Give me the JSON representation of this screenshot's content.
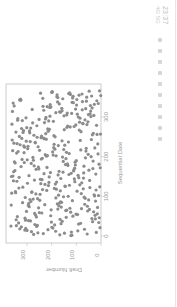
{
  "status_bar": {
    "time": "23:37",
    "info": "4G 5G",
    "icons": [
      "notification-icon",
      "app-icon",
      "app-icon",
      "app-icon",
      "app-icon",
      "app-icon",
      "app-icon",
      "app-icon",
      "app-icon",
      "app-icon"
    ]
  },
  "chart_data": {
    "type": "scatter",
    "title": "",
    "xlabel": "Sequential Date",
    "ylabel": "Draft Number",
    "xlim": [
      0,
      366
    ],
    "ylim": [
      0,
      366
    ],
    "xticks": [
      0,
      100,
      200,
      300
    ],
    "yticks": [
      0,
      100,
      200,
      300
    ],
    "grid": false,
    "orientation": "rotated 90 degrees clockwise",
    "marker_color": "#8c8c8c",
    "points_note": "366 points, one per day of year; values estimated from pixel positions",
    "x": [],
    "y": []
  },
  "colors": {
    "marker": "#8c8c8c",
    "frame": "#bfbfbf",
    "text": "#9a9a9a",
    "background": "#ffffff"
  }
}
